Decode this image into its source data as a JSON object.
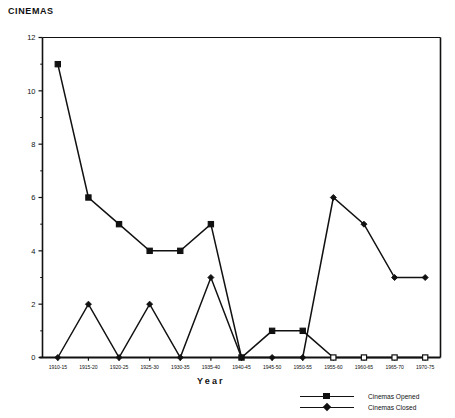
{
  "chart_data": {
    "type": "line",
    "title": "CINEMAS",
    "xlabel": "Year",
    "ylabel": "",
    "ylim": [
      0,
      12
    ],
    "ytick_labels": [
      "0",
      "2",
      "4",
      "6",
      "8",
      "10",
      "12"
    ],
    "ytick_values": [
      0,
      2,
      4,
      6,
      8,
      10,
      12
    ],
    "yminor_values": [
      1,
      3,
      5,
      7,
      9,
      11
    ],
    "grid": false,
    "legend_position": "bottom-right",
    "categories": [
      "1910-15",
      "1915-20",
      "1920-25",
      "1925-30",
      "1930-35",
      "1935-40",
      "1940-45",
      "1945-50",
      "1950-55",
      "1955-60",
      "1960-65",
      "1965-70",
      "1970-75"
    ],
    "series": [
      {
        "name": "Cinemas Opened",
        "marker": "square",
        "values": [
          11,
          6,
          5,
          4,
          4,
          5,
          0,
          1,
          1,
          0,
          0,
          0,
          0
        ]
      },
      {
        "name": "Cinemas Closed",
        "marker": "diamond",
        "values": [
          0,
          2,
          0,
          2,
          0,
          3,
          0,
          0,
          0,
          6,
          5,
          3,
          3
        ]
      }
    ]
  },
  "figure": {
    "title": "CINEMAS",
    "axis_title_x": "Year"
  },
  "legend": {
    "items": [
      {
        "label": "Cinemas Opened",
        "marker": "square-marker"
      },
      {
        "label": "Cinemas Closed",
        "marker": "diamond-marker"
      }
    ]
  },
  "colors": {
    "ink": "#111111",
    "background": "#ffffff"
  }
}
